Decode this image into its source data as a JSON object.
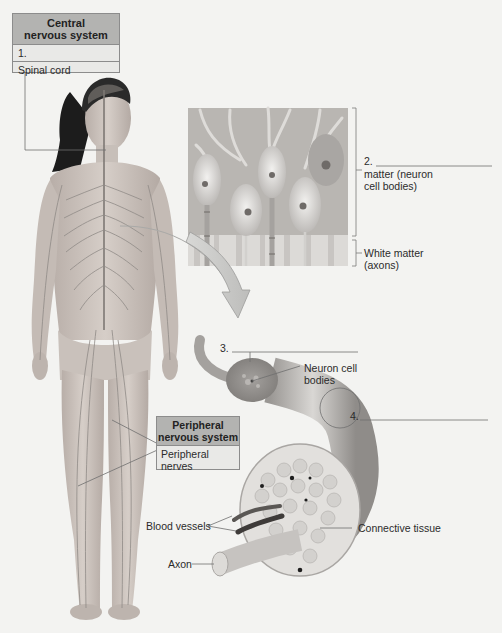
{
  "figure": {
    "background_color": "#f3f3f1"
  },
  "cns_box": {
    "title_line1": "Central",
    "title_line2": "nervous system",
    "blank_1": "1.",
    "item": "Spinal cord"
  },
  "pns_box": {
    "title_line1": "Peripheral",
    "title_line2": "nervous system",
    "item_line1": "Peripheral",
    "item_line2": "nerves"
  },
  "spinal_cord_section": {
    "blank_2": "2.",
    "gray_matter_line1": "matter (neuron",
    "gray_matter_line2": "cell bodies)",
    "white_matter_line1": "White matter",
    "white_matter_line2": "(axons)"
  },
  "nerve_detail": {
    "blank_3": "3.",
    "neuron_cell_bodies_line1": "Neuron cell",
    "neuron_cell_bodies_line2": "bodies",
    "blank_4": "4.",
    "blood_vessels": "Blood vessels",
    "connective_tissue": "Connective tissue",
    "axon": "Axon"
  },
  "colors": {
    "box_header": "#b3b3b1",
    "box_body": "#e9e9e7",
    "box_border": "#8c8c8c",
    "skin": "#cfc6bf",
    "nerve": "#8f8a86",
    "hair": "#1c1c1c",
    "panel_bg": "#b9b6b2"
  }
}
